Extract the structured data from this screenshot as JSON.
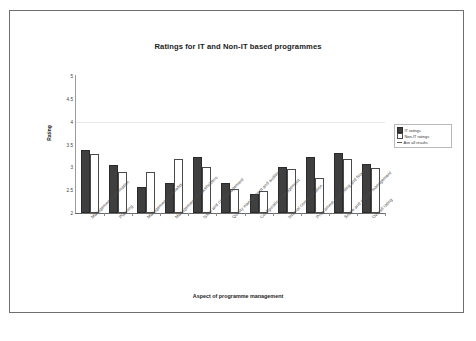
{
  "chart_data": {
    "type": "bar",
    "title": "Ratings for IT and Non-IT based programmes",
    "xlabel": "Aspect of programme management",
    "ylabel": "Rating",
    "ylim": [
      2,
      5
    ],
    "yticks": [
      "2",
      "2.5",
      "3",
      "3.5",
      "4",
      "4.5",
      "5"
    ],
    "grid": true,
    "legend_position": "right",
    "categories": [
      "Management organisation",
      "Planning",
      "Management of benefits",
      "Management of stakeholders",
      "Issue and risk management",
      "Quality management and auditing",
      "Configuration management",
      "Internal communication",
      "Programme Accounting and finance",
      "Scope and change management",
      "Overall rating"
    ],
    "series": [
      {
        "name": "IT ratings",
        "color": "#3f3f3f",
        "values": [
          3.38,
          3.05,
          2.56,
          2.66,
          3.23,
          2.66,
          2.42,
          3.0,
          3.23,
          3.31,
          3.08
        ]
      },
      {
        "name": "Non-IT ratings",
        "color": "#ffffff",
        "values": [
          3.3,
          2.89,
          2.9,
          3.19,
          3.0,
          2.52,
          2.49,
          2.96,
          2.76,
          3.18,
          2.99
        ]
      }
    ],
    "legend": [
      {
        "label": "IT ratings",
        "marker": "filled-square"
      },
      {
        "label": "Non-IT ratings",
        "marker": "open-square"
      },
      {
        "label": "Ave all results",
        "marker": "line"
      }
    ]
  }
}
